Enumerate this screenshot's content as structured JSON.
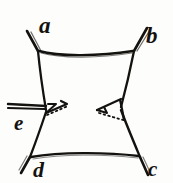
{
  "figure": {
    "background_color": "#fdfdfb",
    "ink_color": "#14120f",
    "labels": [
      {
        "id": "a",
        "text": "a",
        "x": 39,
        "y": 14,
        "position": "top-left"
      },
      {
        "id": "b",
        "text": "b",
        "x": 146,
        "y": 24,
        "position": "top-right"
      },
      {
        "id": "c",
        "text": "c",
        "x": 148,
        "y": 159,
        "position": "bottom-right"
      },
      {
        "id": "d",
        "text": "d",
        "x": 33,
        "y": 159,
        "position": "bottom-left"
      },
      {
        "id": "e",
        "text": "e",
        "x": 14,
        "y": 113,
        "position": "middle-left"
      }
    ],
    "vertices": {
      "a": {
        "x": 38,
        "y": 50
      },
      "b": {
        "x": 134,
        "y": 50
      },
      "c": {
        "x": 140,
        "y": 157
      },
      "d": {
        "x": 30,
        "y": 157
      },
      "left_waist": {
        "x": 46,
        "y": 110
      },
      "right_waist": {
        "x": 121,
        "y": 108
      }
    },
    "strokes": {
      "top_edge": "a to b, slightly bowed",
      "bottom_edge": "d to c, slightly bowed",
      "left_side": "a down to left waist, then down to d",
      "right_side": "b down to right waist, then down to c",
      "a_tail": "short stroke up-left past a",
      "b_tail": "short stroke up-right past b",
      "c_tail": "short stroke down-right past c",
      "d_tail": "short stroke down-left past d",
      "e_bar": "horizontal double bar from left border to left waist",
      "left_triangle": "solid wedge pointing right from left waist, dotted closing edge",
      "right_triangle": "solid wedge pointing left from right waist, dotted closing edge"
    },
    "dotted_segments": [
      {
        "name": "left-wedge-dotted-edge",
        "from": {
          "x": 46,
          "y": 114
        },
        "to": {
          "x": 66,
          "y": 107
        }
      },
      {
        "name": "right-wedge-dotted-edge",
        "from": {
          "x": 98,
          "y": 112
        },
        "to": {
          "x": 122,
          "y": 119
        }
      }
    ]
  }
}
